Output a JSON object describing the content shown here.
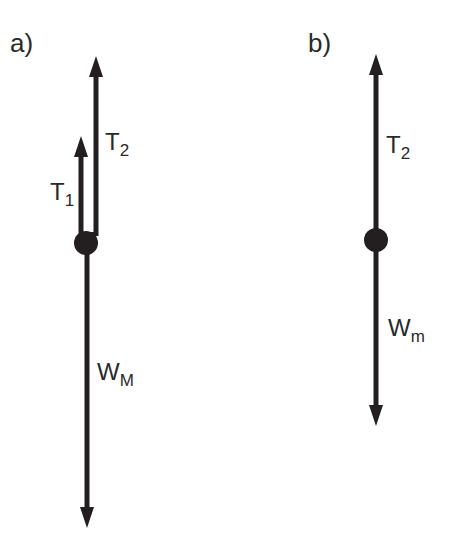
{
  "diagram": {
    "colors": {
      "ink": "#231f20",
      "background": "#ffffff"
    },
    "panel_a": {
      "label": "a)",
      "forces": [
        {
          "name": "T",
          "sub": "1",
          "direction": "up"
        },
        {
          "name": "T",
          "sub": "2",
          "direction": "up"
        },
        {
          "name": "W",
          "sub": "M",
          "direction": "down"
        }
      ]
    },
    "panel_b": {
      "label": "b)",
      "forces": [
        {
          "name": "T",
          "sub": "2",
          "direction": "up"
        },
        {
          "name": "W",
          "sub": "m",
          "direction": "down"
        }
      ]
    }
  }
}
